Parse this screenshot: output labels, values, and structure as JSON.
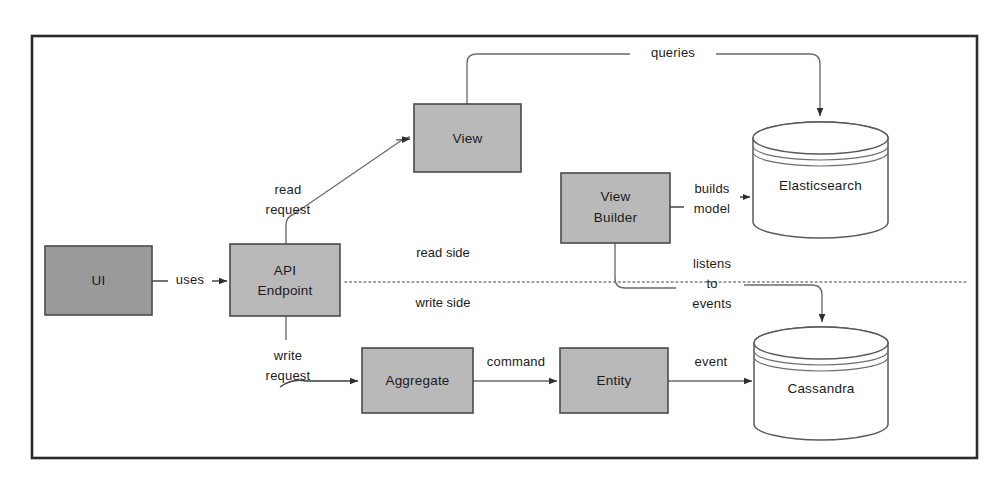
{
  "diagram": {
    "frame": {
      "present": true,
      "color": "#2b2b2b"
    },
    "colors": {
      "box_fill_dark": "#9a9a9a",
      "box_fill_light": "#b9b9b9",
      "box_stroke": "#4a4a4a",
      "cylinder_fill": "#ffffff",
      "cylinder_stroke": "#5a5a5a",
      "connector": "#6a6a6a",
      "connector_dark": "#3d3d3d",
      "divider": "#7a7a7a",
      "text": "#1b1b1b"
    },
    "nodes": [
      {
        "id": "ui",
        "label": "UI",
        "shape": "rect",
        "fill": "#9a9a9a"
      },
      {
        "id": "api_endpoint",
        "label": "API\nEndpoint",
        "line1": "API",
        "line2": "Endpoint",
        "shape": "rect",
        "fill": "#b9b9b9"
      },
      {
        "id": "view",
        "label": "View",
        "shape": "rect",
        "fill": "#b9b9b9"
      },
      {
        "id": "view_builder",
        "label": "View\nBuilder",
        "line1": "View",
        "line2": "Builder",
        "shape": "rect",
        "fill": "#b9b9b9"
      },
      {
        "id": "aggregate",
        "label": "Aggregate",
        "shape": "rect",
        "fill": "#b9b9b9"
      },
      {
        "id": "entity",
        "label": "Entity",
        "shape": "rect",
        "fill": "#b9b9b9"
      },
      {
        "id": "elasticsearch",
        "label": "Elasticsearch",
        "shape": "cylinder",
        "fill": "#ffffff"
      },
      {
        "id": "cassandra",
        "label": "Cassandra",
        "shape": "cylinder",
        "fill": "#ffffff"
      }
    ],
    "edges": [
      {
        "id": "uses",
        "from": "ui",
        "to": "api_endpoint",
        "label": "uses"
      },
      {
        "id": "read_request",
        "from": "api_endpoint",
        "to": "view",
        "label": "read\nrequest",
        "line1": "read",
        "line2": "request"
      },
      {
        "id": "queries",
        "from": "view",
        "to": "elasticsearch",
        "label": "queries"
      },
      {
        "id": "builds_model",
        "from": "view_builder",
        "to": "elasticsearch",
        "label": "builds\nmodel",
        "line1": "builds",
        "line2": "model"
      },
      {
        "id": "listens",
        "from": "view_builder",
        "to": "cassandra",
        "label": "listens\nto\nevents",
        "line1": "listens",
        "line2": "to",
        "line3": "events"
      },
      {
        "id": "write_request",
        "from": "api_endpoint",
        "to": "aggregate",
        "label": "write\nrequest",
        "line1": "write",
        "line2": "request"
      },
      {
        "id": "command",
        "from": "aggregate",
        "to": "entity",
        "label": "command"
      },
      {
        "id": "event",
        "from": "entity",
        "to": "cassandra",
        "label": "event"
      }
    ],
    "divider": {
      "above_label": "read side",
      "below_label": "write side",
      "style": "dotted"
    }
  }
}
